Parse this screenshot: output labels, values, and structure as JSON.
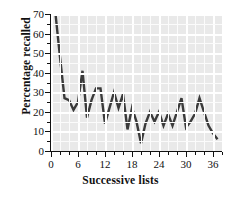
{
  "chart_data": {
    "type": "line",
    "title": "",
    "xlabel": "Successive lists",
    "ylabel": "Percentage recalled",
    "xlim": [
      0,
      38
    ],
    "ylim": [
      0,
      70
    ],
    "xticks": [
      0,
      6,
      12,
      18,
      24,
      30,
      36
    ],
    "yticks": [
      0,
      10,
      20,
      30,
      40,
      50,
      60,
      70
    ],
    "xtick_minor_step": 2,
    "ytick_minor_step": 5,
    "grid": true,
    "grid_color": "#ffffff",
    "panel_color": "#e9e9e9",
    "line_color": "#3a3a3a",
    "line_width": 2.4,
    "legend": "none",
    "x": [
      1,
      2,
      3,
      4,
      5,
      6,
      7,
      8,
      9,
      10,
      11,
      12,
      13,
      14,
      15,
      16,
      17,
      18,
      19,
      20,
      21,
      22,
      23,
      24,
      25,
      26,
      27,
      28,
      29,
      30,
      31,
      32,
      33,
      34,
      35,
      36,
      37
    ],
    "values": [
      70,
      48,
      27,
      26,
      21,
      25,
      41,
      17,
      26,
      32,
      32,
      14,
      22,
      30,
      22,
      29,
      11,
      22,
      15,
      4,
      14,
      20,
      15,
      20,
      13,
      19,
      13,
      20,
      27,
      12,
      15,
      19,
      27,
      20,
      13,
      9,
      6
    ],
    "series": [
      {
        "name": "Percentage recalled",
        "values": [
          70,
          48,
          27,
          26,
          21,
          25,
          41,
          17,
          26,
          32,
          32,
          14,
          22,
          30,
          22,
          29,
          11,
          22,
          15,
          4,
          14,
          20,
          15,
          20,
          13,
          19,
          13,
          20,
          27,
          12,
          15,
          19,
          27,
          20,
          13,
          9,
          6
        ]
      }
    ]
  }
}
